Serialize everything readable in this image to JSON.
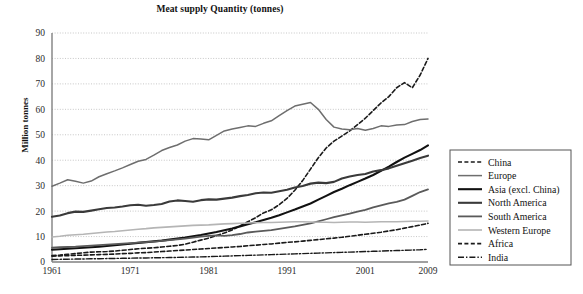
{
  "chart": {
    "title": "Meat supply Quantity (tonnes)",
    "ylabel": "Million tonnes"
  },
  "chart_data": {
    "type": "line",
    "title": "Meat supply Quantity (tonnes)",
    "xlabel": "",
    "ylabel": "Million tonnes",
    "xlim": [
      1961,
      2009
    ],
    "ylim": [
      0,
      90
    ],
    "ytick_step": 10,
    "grid": true,
    "grid_style": "dotted-horizontal",
    "legend_position": "right-outside",
    "xticks": [
      1961,
      1971,
      1981,
      1991,
      2001,
      2009
    ],
    "yticks": [
      0,
      10,
      20,
      30,
      40,
      50,
      60,
      70,
      80,
      90
    ],
    "x": [
      1961,
      1962,
      1963,
      1964,
      1965,
      1966,
      1967,
      1968,
      1969,
      1970,
      1971,
      1972,
      1973,
      1974,
      1975,
      1976,
      1977,
      1978,
      1979,
      1980,
      1981,
      1982,
      1983,
      1984,
      1985,
      1986,
      1987,
      1988,
      1989,
      1990,
      1991,
      1992,
      1993,
      1994,
      1995,
      1996,
      1997,
      1998,
      1999,
      2000,
      2001,
      2002,
      2003,
      2004,
      2005,
      2006,
      2007,
      2008,
      2009
    ],
    "series": [
      {
        "name": "China",
        "style": "dashed",
        "color": "#1a1a1a",
        "width": 1.6,
        "values": [
          2.5,
          2.7,
          3.0,
          3.3,
          3.6,
          3.9,
          4.0,
          4.1,
          4.3,
          4.6,
          4.9,
          5.2,
          5.4,
          5.6,
          5.9,
          6.2,
          6.5,
          7.0,
          7.8,
          8.6,
          9.4,
          10.4,
          11.4,
          12.6,
          14.2,
          15.8,
          17.4,
          19.3,
          20.5,
          22.5,
          25.0,
          28.2,
          32.0,
          36.5,
          41.0,
          44.8,
          47.5,
          49.5,
          51.5,
          54.0,
          56.5,
          59.5,
          62.5,
          65.0,
          68.5,
          70.5,
          68.5,
          73.5,
          80.0
        ]
      },
      {
        "name": "Europe",
        "style": "solid",
        "color": "#6e6e6e",
        "width": 1.5,
        "values": [
          29.8,
          31.0,
          32.3,
          31.7,
          31.0,
          31.8,
          33.5,
          34.7,
          35.8,
          37.0,
          38.3,
          39.6,
          40.3,
          42.0,
          43.8,
          45.0,
          46.0,
          47.5,
          48.5,
          48.3,
          48.0,
          49.8,
          51.5,
          52.3,
          52.9,
          53.5,
          53.3,
          54.5,
          55.5,
          57.5,
          59.5,
          61.3,
          62.0,
          62.7,
          60.0,
          56.0,
          53.0,
          52.3,
          52.0,
          52.5,
          51.8,
          52.5,
          53.5,
          53.3,
          53.8,
          54.0,
          55.2,
          56.0,
          56.2
        ]
      },
      {
        "name": "Asia (excl. China)",
        "style": "solid",
        "color": "#111111",
        "width": 2.1,
        "values": [
          4.8,
          5.0,
          5.2,
          5.4,
          5.6,
          5.8,
          6.0,
          6.3,
          6.6,
          6.9,
          7.2,
          7.5,
          7.8,
          8.1,
          8.4,
          8.8,
          9.2,
          9.6,
          10.1,
          10.6,
          11.2,
          11.8,
          12.5,
          13.2,
          14.0,
          14.8,
          15.6,
          16.5,
          17.4,
          18.4,
          19.5,
          20.6,
          21.8,
          23.0,
          24.5,
          26.0,
          27.5,
          28.8,
          30.2,
          31.5,
          32.8,
          34.2,
          35.8,
          37.5,
          39.3,
          41.0,
          42.5,
          44.0,
          45.8
        ]
      },
      {
        "name": "North America",
        "style": "solid",
        "color": "#3a3a3a",
        "width": 2.1,
        "values": [
          17.8,
          18.3,
          19.2,
          19.8,
          19.7,
          20.2,
          20.7,
          21.2,
          21.4,
          21.8,
          22.3,
          22.5,
          22.1,
          22.4,
          22.8,
          23.8,
          24.2,
          24.0,
          23.7,
          24.3,
          24.6,
          24.5,
          24.9,
          25.3,
          25.9,
          26.3,
          27.0,
          27.3,
          27.2,
          27.8,
          28.4,
          29.3,
          29.9,
          30.8,
          31.2,
          31.0,
          31.5,
          32.8,
          33.6,
          34.2,
          34.6,
          35.6,
          36.1,
          36.8,
          37.8,
          38.8,
          39.8,
          40.9,
          41.8
        ]
      },
      {
        "name": "South America",
        "style": "solid",
        "color": "#5a5a5a",
        "width": 1.8,
        "values": [
          5.6,
          5.8,
          5.9,
          6.0,
          6.2,
          6.4,
          6.6,
          6.8,
          7.0,
          7.2,
          7.4,
          7.6,
          7.8,
          8.0,
          8.3,
          8.6,
          8.9,
          9.2,
          9.6,
          10.0,
          10.3,
          10.5,
          10.3,
          10.6,
          11.0,
          11.6,
          11.9,
          12.2,
          12.5,
          13.0,
          13.5,
          14.0,
          14.6,
          15.2,
          16.0,
          16.8,
          17.6,
          18.3,
          19.0,
          19.8,
          20.5,
          21.5,
          22.3,
          23.0,
          23.6,
          24.5,
          26.0,
          27.5,
          28.5
        ]
      },
      {
        "name": "Western Europe",
        "style": "solid",
        "color": "#b5b5b5",
        "width": 1.6,
        "values": [
          9.8,
          10.1,
          10.5,
          10.7,
          10.9,
          11.2,
          11.5,
          11.8,
          12.0,
          12.3,
          12.6,
          12.9,
          13.1,
          13.4,
          13.6,
          13.8,
          14.0,
          14.2,
          14.4,
          14.5,
          14.6,
          14.8,
          15.0,
          15.1,
          15.2,
          15.3,
          15.4,
          15.5,
          15.5,
          15.6,
          15.7,
          15.8,
          15.8,
          15.7,
          15.6,
          15.6,
          15.5,
          15.6,
          15.7,
          15.7,
          15.6,
          15.7,
          15.8,
          15.8,
          15.8,
          15.9,
          16.0,
          16.0,
          16.1
        ]
      },
      {
        "name": "Africa",
        "style": "dashed",
        "color": "#1a1a1a",
        "width": 1.6,
        "values": [
          2.3,
          2.4,
          2.5,
          2.6,
          2.7,
          2.8,
          2.9,
          3.0,
          3.1,
          3.3,
          3.4,
          3.6,
          3.7,
          3.9,
          4.1,
          4.3,
          4.5,
          4.7,
          4.9,
          5.1,
          5.3,
          5.5,
          5.7,
          5.9,
          6.1,
          6.4,
          6.6,
          6.9,
          7.1,
          7.4,
          7.7,
          7.9,
          8.2,
          8.5,
          8.8,
          9.1,
          9.4,
          9.7,
          10.1,
          10.5,
          10.9,
          11.3,
          11.7,
          12.2,
          12.7,
          13.3,
          13.9,
          14.5,
          15.2
        ]
      },
      {
        "name": "India",
        "style": "dashdot",
        "color": "#1a1a1a",
        "width": 1.4,
        "values": [
          1.0,
          1.05,
          1.1,
          1.15,
          1.2,
          1.25,
          1.3,
          1.35,
          1.4,
          1.45,
          1.5,
          1.55,
          1.6,
          1.65,
          1.7,
          1.75,
          1.8,
          1.9,
          1.95,
          2.0,
          2.1,
          2.2,
          2.3,
          2.4,
          2.5,
          2.6,
          2.7,
          2.8,
          2.9,
          3.0,
          3.1,
          3.2,
          3.3,
          3.4,
          3.5,
          3.6,
          3.7,
          3.8,
          3.9,
          4.0,
          4.1,
          4.2,
          4.3,
          4.4,
          4.5,
          4.6,
          4.7,
          4.8,
          5.0
        ]
      }
    ]
  }
}
